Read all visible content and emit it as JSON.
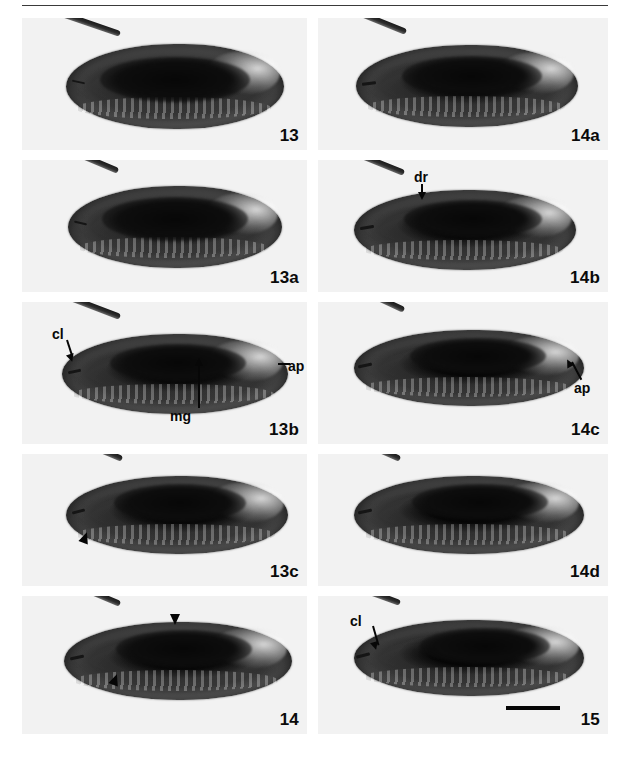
{
  "figure": {
    "type": "photographic-plate",
    "columns": 2,
    "rows": 5,
    "background_color": "#ffffff",
    "panel_background_color": "#f2f2f2",
    "ink_color": "#080808",
    "has_top_rule": true
  },
  "panels": [
    {
      "id": "panel-13",
      "label": "13",
      "row": 0,
      "column": "left",
      "annotations": []
    },
    {
      "id": "panel-14a",
      "label": "14a",
      "row": 0,
      "column": "right",
      "annotations": []
    },
    {
      "id": "panel-13a",
      "label": "13a",
      "row": 1,
      "column": "left",
      "annotations": []
    },
    {
      "id": "panel-14b",
      "label": "14b",
      "row": 1,
      "column": "right",
      "annotations": [
        {
          "text": "dr",
          "marker": "arrow-down"
        }
      ]
    },
    {
      "id": "panel-13b",
      "label": "13b",
      "row": 2,
      "column": "left",
      "annotations": [
        {
          "text": "cl",
          "marker": "arrow-down-right"
        },
        {
          "text": "ap",
          "marker": "tick-left"
        },
        {
          "text": "mg",
          "marker": "arrow-up"
        }
      ]
    },
    {
      "id": "panel-14c",
      "label": "14c",
      "row": 2,
      "column": "right",
      "annotations": [
        {
          "text": "ap",
          "marker": "arrow-up-left"
        }
      ]
    },
    {
      "id": "panel-13c",
      "label": "13c",
      "row": 3,
      "column": "left",
      "annotations": [
        {
          "text": "",
          "marker": "arrowhead-up"
        }
      ]
    },
    {
      "id": "panel-14d",
      "label": "14d",
      "row": 3,
      "column": "right",
      "annotations": []
    },
    {
      "id": "panel-14",
      "label": "14",
      "row": 4,
      "column": "left",
      "annotations": [
        {
          "text": "",
          "marker": "arrowhead-down"
        },
        {
          "text": "",
          "marker": "arrowhead-down"
        }
      ]
    },
    {
      "id": "panel-15",
      "label": "15",
      "row": 4,
      "column": "right",
      "annotations": [
        {
          "text": "cl",
          "marker": "arrow-down-right"
        }
      ],
      "scale_bar": {
        "present": true,
        "label": ""
      }
    }
  ],
  "labels": {
    "p13": "13",
    "p14a": "14a",
    "p13a": "13a",
    "p14b": "14b",
    "p13b": "13b",
    "p14c": "14c",
    "p13c": "13c",
    "p14d": "14d",
    "p14": "14",
    "p15": "15"
  },
  "annotation_text": {
    "dr": "dr",
    "cl": "cl",
    "ap": "ap",
    "mg": "mg",
    "cl15": "cl",
    "ap14c": "ap"
  }
}
